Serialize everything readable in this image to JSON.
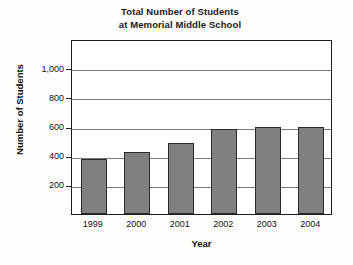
{
  "chart_data": {
    "type": "bar",
    "title": "Total Number of Students at Memorial Middle School",
    "title_lines": [
      "Total Number of Students",
      "at Memorial Middle School"
    ],
    "xlabel": "Year",
    "ylabel": "Number of Students",
    "categories": [
      "1999",
      "2000",
      "2001",
      "2002",
      "2003",
      "2004"
    ],
    "values": [
      375,
      425,
      490,
      580,
      600,
      595
    ],
    "ylim": [
      0,
      1200
    ],
    "ytick_values": [
      200,
      400,
      600,
      800,
      1000
    ],
    "ytick_labels": [
      "200",
      "400",
      "600",
      "800",
      "1,000"
    ],
    "grid": true,
    "legend": false,
    "bar_color": "#808080",
    "bar_border_color": "#2b2b2b",
    "frame_color": "#1c1c1c",
    "gridline_color": "#7a7a7a",
    "background_color": "#fdfdfb"
  }
}
